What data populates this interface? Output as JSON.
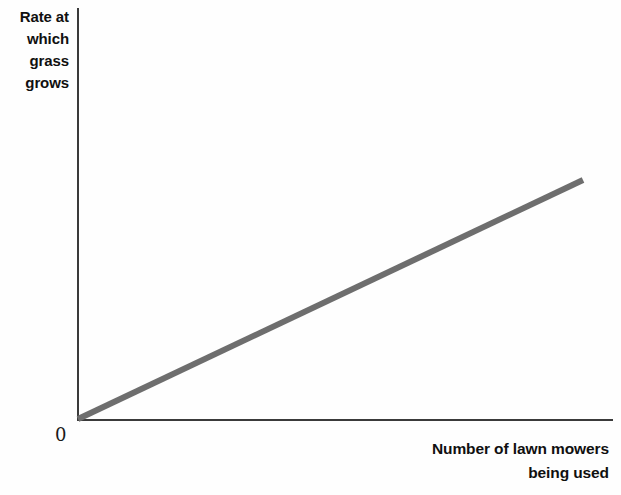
{
  "chart_data": {
    "type": "line",
    "title": "",
    "xlabel": "Number of lawn mowers being used",
    "ylabel": "Rate at which grass grows",
    "grid": false,
    "legend": null,
    "axis_origin_label": "0",
    "xlim": [
      0,
      1
    ],
    "ylim": [
      0,
      1
    ],
    "x_ticks": [],
    "y_ticks": [],
    "series": [
      {
        "name": "Rate at which grass grows",
        "color": "#6e6e6e",
        "line_width": 6,
        "x": [
          0.0,
          1.0
        ],
        "values": [
          0.0,
          1.0
        ],
        "description": "Straight line of positive constant slope starting at the origin"
      }
    ]
  },
  "labels": {
    "y_axis": {
      "lines": [
        "Rate at",
        "which",
        "grass",
        "grows"
      ],
      "full": "Rate at which grass grows"
    },
    "x_axis": {
      "lines": [
        "Number of lawn mowers",
        "being used"
      ],
      "full": "Number of lawn mowers being used"
    },
    "origin": "0"
  },
  "colors": {
    "background": "#fefefe",
    "axis": "#3a3a3a",
    "series_line": "#6e6e6e",
    "text": "#101010"
  },
  "geometry": {
    "origin_px": [
      78,
      419
    ],
    "line_end_px": [
      583,
      180
    ],
    "y_axis_top_px": 8,
    "x_axis_right_px": 614
  }
}
